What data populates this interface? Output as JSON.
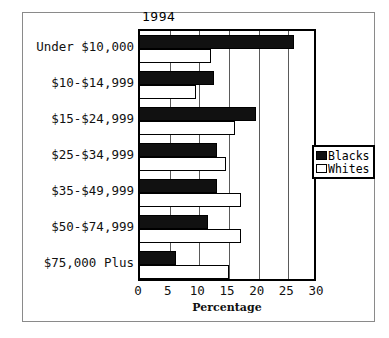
{
  "chart_data": {
    "type": "bar",
    "orientation": "horizontal",
    "title": "1994",
    "xlabel": "Percentage",
    "ylabel": "",
    "xlim": [
      0,
      30
    ],
    "xticks": [
      0,
      5,
      10,
      15,
      20,
      25,
      30
    ],
    "grid": true,
    "grid_axis": "x",
    "legend_position": "right",
    "categories": [
      "Under $10,000",
      "$10-$14,999",
      "$15-$24,999",
      "$25-$34,999",
      "$35-$49,999",
      "$50-$74,999",
      "$75,000 Plus"
    ],
    "series": [
      {
        "name": "Blacks",
        "color": "#111111",
        "values": [
          26.0,
          12.5,
          19.5,
          13.0,
          13.0,
          11.5,
          6.0
        ]
      },
      {
        "name": "Whites",
        "color": "#ffffff",
        "values": [
          12.0,
          9.5,
          16.0,
          14.5,
          17.0,
          17.0,
          15.0
        ]
      }
    ]
  },
  "legend": {
    "entries": [
      {
        "label": "Blacks",
        "swatch": "filled-black"
      },
      {
        "label": "Whites",
        "swatch": "outline-white"
      }
    ]
  }
}
